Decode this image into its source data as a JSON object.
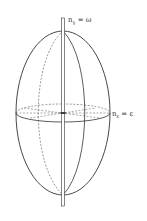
{
  "figure": {
    "type": "uniaxial index ellipsoid",
    "labels": {
      "top_axis": {
        "base": "n",
        "sub": "γ",
        "eq": " = ω"
      },
      "equator": {
        "base": "n",
        "sub": "ε",
        "eq": " = ε"
      }
    },
    "colors": {
      "stroke": "#333333",
      "background": "#ffffff"
    }
  }
}
